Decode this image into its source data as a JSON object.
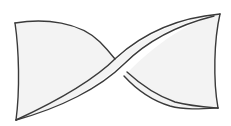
{
  "figure": {
    "colors": {
      "stroke": "#3a3a3a",
      "fill": "#f3f3f3",
      "background": "#ffffff"
    }
  }
}
